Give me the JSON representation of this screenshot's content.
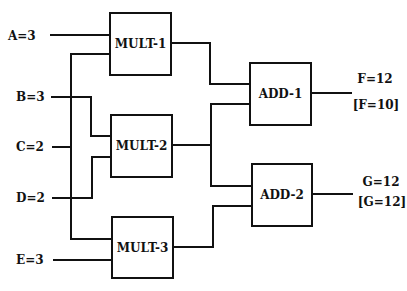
{
  "inputs": [
    {
      "id": "A",
      "text": "A=3"
    },
    {
      "id": "B",
      "text": "B=3"
    },
    {
      "id": "C",
      "text": "C=2"
    },
    {
      "id": "D",
      "text": "D=2"
    },
    {
      "id": "E",
      "text": "E=3"
    }
  ],
  "components": [
    {
      "id": "MULT-1",
      "label": "MULT-1",
      "type": "multiplier"
    },
    {
      "id": "MULT-2",
      "label": "MULT-2",
      "type": "multiplier"
    },
    {
      "id": "MULT-3",
      "label": "MULT-3",
      "type": "multiplier"
    },
    {
      "id": "ADD-1",
      "label": "ADD-1",
      "type": "adder"
    },
    {
      "id": "ADD-2",
      "label": "ADD-2",
      "type": "adder"
    }
  ],
  "outputs": [
    {
      "id": "F",
      "observed": "F=12",
      "predicted": "[F=10]"
    },
    {
      "id": "G",
      "observed": "G=12",
      "predicted": "[G=12]"
    }
  ],
  "connections": [
    {
      "from": "A",
      "to": "MULT-1"
    },
    {
      "from": "C",
      "to": "MULT-1"
    },
    {
      "from": "B",
      "to": "MULT-2"
    },
    {
      "from": "D",
      "to": "MULT-2"
    },
    {
      "from": "C",
      "to": "MULT-3"
    },
    {
      "from": "E",
      "to": "MULT-3"
    },
    {
      "from": "MULT-1",
      "to": "ADD-1"
    },
    {
      "from": "MULT-2",
      "to": "ADD-1"
    },
    {
      "from": "MULT-2",
      "to": "ADD-2"
    },
    {
      "from": "MULT-3",
      "to": "ADD-2"
    },
    {
      "from": "ADD-1",
      "to": "F"
    },
    {
      "from": "ADD-2",
      "to": "G"
    }
  ]
}
